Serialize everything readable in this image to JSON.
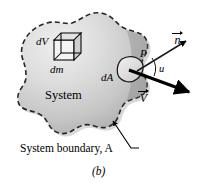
{
  "figure": {
    "caption": "(b)",
    "labels": {
      "volume_element": "dV",
      "mass_element": "dm",
      "area_element": "dA",
      "system": "System",
      "pressure": "P",
      "angle": "u",
      "normal_vector": "n",
      "velocity_vector": "V",
      "boundary": "System boundary, A"
    },
    "colors": {
      "ink": "#000000",
      "background": "#ffffff",
      "blob_light": "#e8e8e8",
      "blob_mid": "#bdbdbd",
      "blob_dark": "#9a9a9a",
      "boundary_dash": "#2b2b2b",
      "leader_line": "#000000"
    },
    "icons": {
      "normal_arrow": "arrow-up-right-icon",
      "velocity_arrow": "arrow-down-right-icon",
      "leader_arrow": "leader-arrow-icon",
      "cube": "cube-wireframe-icon"
    }
  }
}
